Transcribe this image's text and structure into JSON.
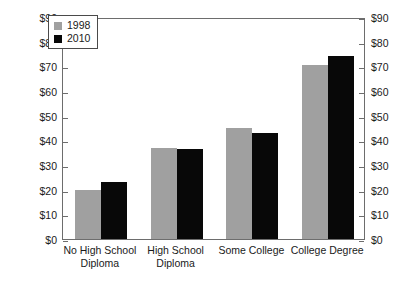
{
  "chart_data": {
    "type": "bar",
    "title": "",
    "subtitle": "",
    "xlabel": "",
    "ylabel": "",
    "ylim": [
      0,
      90
    ],
    "grid": false,
    "legend_position": "top-left",
    "categories": [
      "No High School Diploma",
      "High School Diploma",
      "Some College",
      "College Degree"
    ],
    "category_lines": [
      [
        "No High School",
        "Diploma"
      ],
      [
        "High School",
        "Diploma"
      ],
      [
        "Some College"
      ],
      [
        "College Degree"
      ]
    ],
    "series": [
      {
        "name": "1998",
        "color": "#a0a0a0",
        "values": [
          20,
          37,
          45,
          70.5
        ]
      },
      {
        "name": "2010",
        "color": "#080808",
        "values": [
          23,
          36.5,
          43,
          74
        ]
      }
    ],
    "y_ticks": [
      0,
      10,
      20,
      30,
      40,
      50,
      60,
      70,
      80,
      90
    ],
    "y_tick_labels_left": [
      "$0",
      "$10",
      "$20",
      "$30",
      "$40",
      "$50",
      "$60",
      "$70",
      "$80",
      "$90"
    ],
    "y_tick_labels_right": [
      "$0",
      "$10",
      "$20",
      "$30",
      "$40",
      "$50",
      "$60",
      "$70",
      "$80",
      "$90"
    ],
    "axis_colors": {
      "frame": "#6d6d6d",
      "text": "#1a1a1a"
    }
  },
  "legend": {
    "entries": [
      {
        "label": "1998",
        "color": "#a0a0a0"
      },
      {
        "label": "2010",
        "color": "#080808"
      }
    ]
  }
}
